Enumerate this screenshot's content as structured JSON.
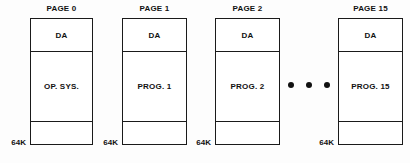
{
  "diagram": {
    "background_color": "#fdfdfd",
    "line_color": "#1a1a1a",
    "text_color": "#111111",
    "capacity_label": "64K",
    "ellipsis_symbol": "• • •",
    "pages": [
      {
        "title": "PAGE 0",
        "top_segment": "DA",
        "main_segment": "OP. SYS.",
        "bottom_segment": "",
        "capacity": "64K",
        "x": 30,
        "width": 63
      },
      {
        "title": "PAGE 1",
        "top_segment": "DA",
        "main_segment": "PROG. 1",
        "bottom_segment": "",
        "capacity": "64K",
        "x": 122,
        "width": 65
      },
      {
        "title": "PAGE 2",
        "top_segment": "DA",
        "main_segment": "PROG. 2",
        "bottom_segment": "",
        "capacity": "64K",
        "x": 215,
        "width": 65
      },
      {
        "title": "PAGE 15",
        "top_segment": "DA",
        "main_segment": "PROG. 15",
        "bottom_segment": "",
        "capacity": "64K",
        "x": 338,
        "width": 65
      }
    ]
  }
}
